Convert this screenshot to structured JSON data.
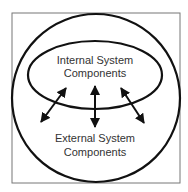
{
  "diagram": {
    "title": "",
    "inner_label": [
      "Internal System",
      "Components"
    ],
    "outer_label": [
      "External System",
      "Components"
    ],
    "arrows": [
      {
        "name": "left",
        "type": "bidirectional"
      },
      {
        "name": "middle",
        "type": "bidirectional"
      },
      {
        "name": "right",
        "type": "bidirectional"
      }
    ],
    "colors": {
      "stroke": "#111111",
      "text": "#333333",
      "frame": "#777777",
      "background": "#ffffff"
    }
  }
}
